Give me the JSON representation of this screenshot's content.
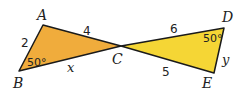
{
  "figure": {
    "triangles": [
      {
        "name": "ABC",
        "fill": "#f0ac3c",
        "vertices": {
          "A": "A",
          "B": "B",
          "C": "C"
        },
        "sides": {
          "AB": "2",
          "AC": "4",
          "BC": "x"
        },
        "angle_B": "50°"
      },
      {
        "name": "CDE",
        "fill": "#f5d635",
        "vertices": {
          "D": "D",
          "E": "E"
        },
        "sides": {
          "CD": "6",
          "CE": "5",
          "DE": "y"
        },
        "angle_D": "50°"
      }
    ],
    "stroke_color": "#1a1a1a"
  }
}
